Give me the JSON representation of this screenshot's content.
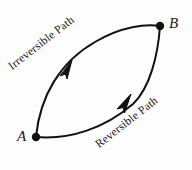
{
  "figure": {
    "type": "thermodynamic-cycle-diagram",
    "background_color": "#fdfdfd",
    "stroke_color": "#111111",
    "width": 192,
    "height": 170
  },
  "nodes": [
    {
      "id": "A",
      "label": "A",
      "x": 36,
      "y": 137
    },
    {
      "id": "B",
      "label": "B",
      "x": 160,
      "y": 26
    }
  ],
  "paths": [
    {
      "id": "irreversible",
      "label": "Irreversible Path",
      "from": "A",
      "to": "B",
      "bulge": "upper-left",
      "arrow_direction": "toward-B",
      "label_rotation_deg": -38
    },
    {
      "id": "reversible",
      "label": "Reversible Path",
      "from": "A",
      "to": "B",
      "bulge": "lower-right",
      "arrow_direction": "toward-B",
      "label_rotation_deg": -38
    }
  ]
}
